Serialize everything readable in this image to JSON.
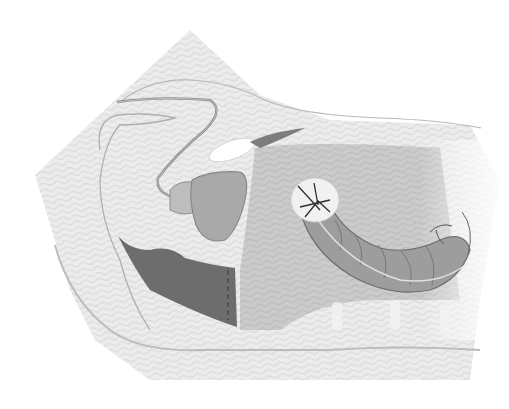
{
  "figure": {
    "type": "anatomical-illustration",
    "labels": [],
    "colors": {
      "background": "#ffffff",
      "body_light": "#e8e8e8",
      "body_mid": "#d6d6d6",
      "abdominal_cavity": "#c4c4c4",
      "colon": "#9a9a9a",
      "colon_outline": "#6f6f6f",
      "rectum_stump": "#6c6c6c",
      "bladder": "#a8a8a8",
      "outline": "#a6a6a6",
      "stoma": "#f1f1f1"
    }
  }
}
